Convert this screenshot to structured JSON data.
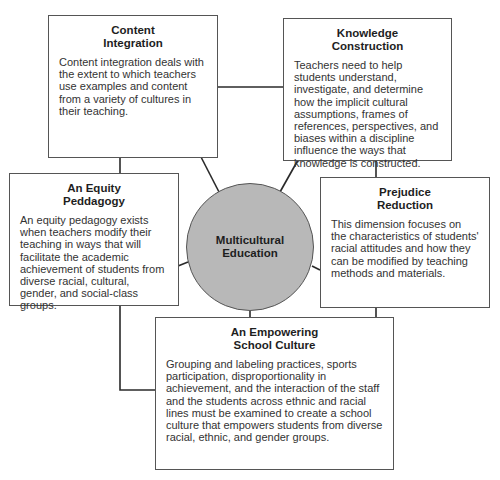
{
  "center": {
    "title": "Multicultural\nEducation",
    "fill_color": "#b8b8b8"
  },
  "dimensions": [
    {
      "id": "content-integration",
      "title": "Content\nIntegration",
      "description": "Content integration deals with the extent to which teachers use examples and content from a variety of cultures in their teaching."
    },
    {
      "id": "knowledge-construction",
      "title": "Knowledge\nConstruction",
      "description": "Teachers need to help students understand, investigate, and determine how the implicit cultural assumptions, frames of references, perspectives, and biases within a discipline influence the ways that knowledge is constructed."
    },
    {
      "id": "equity-pedagogy",
      "title": "An Equity\nPeddagogy",
      "description": "An equity pedagogy exists when teachers modify their teaching in ways that will facilitate the academic achievement of students from diverse racial, cultural, gender, and social-class groups."
    },
    {
      "id": "prejudice-reduction",
      "title": "Prejudice\nReduction",
      "description": "This dimension focuses on the characteristics of students' racial attitudes and how they can be modified by teaching methods and materials."
    },
    {
      "id": "empowering-school-culture",
      "title": "An Empowering\nSchool Culture",
      "description": "Grouping and labeling practices, sports participation, disproportionality in achievement, and the interaction of the staff and the students across ethnic and racial lines must be examined to create a school culture that empowers students from diverse racial, ethnic, and gender groups."
    }
  ]
}
